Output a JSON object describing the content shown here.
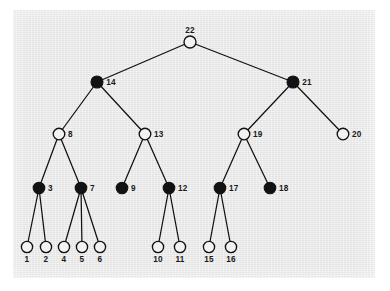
{
  "figure": {
    "title": "",
    "panel": {
      "background_color": "#e8e8e8",
      "border_color": "#ffffff",
      "x": 13,
      "y": 10,
      "width": 362,
      "height": 268
    },
    "style": {
      "edge_color": "#111111",
      "open_node_fill": "#f2f2f2",
      "filled_node_fill": "#121212",
      "node_stroke": "#111111",
      "label_color": "#1a1a1a"
    }
  },
  "chart_data": {
    "type": "diagram",
    "diagram_kind": "rooted-tree",
    "title": "",
    "xlabel": "",
    "ylabel": "",
    "legend": [
      {
        "marker": "filled-circle",
        "label": "black node"
      },
      {
        "marker": "open-circle",
        "label": "white node"
      }
    ],
    "node_count": 22,
    "levels": 5,
    "nodes": [
      {
        "id": "1",
        "label": "1",
        "fill": "open",
        "x": 27,
        "y": 247,
        "r": 5.6,
        "label_pos": "below",
        "depth": 4
      },
      {
        "id": "2",
        "label": "2",
        "fill": "open",
        "x": 46,
        "y": 247,
        "r": 5.6,
        "label_pos": "below",
        "depth": 4
      },
      {
        "id": "3",
        "label": "3",
        "fill": "filled",
        "x": 39,
        "y": 188,
        "r": 5.8,
        "label_pos": "right",
        "depth": 3
      },
      {
        "id": "4",
        "label": "4",
        "fill": "open",
        "x": 64,
        "y": 247,
        "r": 5.6,
        "label_pos": "below",
        "depth": 4
      },
      {
        "id": "5",
        "label": "5",
        "fill": "open",
        "x": 82,
        "y": 247,
        "r": 5.6,
        "label_pos": "below",
        "depth": 4
      },
      {
        "id": "6",
        "label": "6",
        "fill": "open",
        "x": 100,
        "y": 247,
        "r": 5.6,
        "label_pos": "below",
        "depth": 4
      },
      {
        "id": "7",
        "label": "7",
        "fill": "filled",
        "x": 81,
        "y": 188,
        "r": 5.8,
        "label_pos": "right",
        "depth": 3
      },
      {
        "id": "8",
        "label": "8",
        "fill": "open",
        "x": 59,
        "y": 134,
        "r": 5.8,
        "label_pos": "right",
        "depth": 2
      },
      {
        "id": "9",
        "label": "9",
        "fill": "filled",
        "x": 122,
        "y": 188,
        "r": 5.8,
        "label_pos": "right",
        "depth": 3
      },
      {
        "id": "10",
        "label": "10",
        "fill": "open",
        "x": 158,
        "y": 247,
        "r": 5.6,
        "label_pos": "below",
        "depth": 4
      },
      {
        "id": "11",
        "label": "11",
        "fill": "open",
        "x": 180,
        "y": 247,
        "r": 5.6,
        "label_pos": "below",
        "depth": 4
      },
      {
        "id": "12",
        "label": "12",
        "fill": "filled",
        "x": 169,
        "y": 188,
        "r": 5.8,
        "label_pos": "right",
        "depth": 3
      },
      {
        "id": "13",
        "label": "13",
        "fill": "open",
        "x": 145,
        "y": 134,
        "r": 5.8,
        "label_pos": "right",
        "depth": 2
      },
      {
        "id": "14",
        "label": "14",
        "fill": "filled",
        "x": 97,
        "y": 82,
        "r": 6.0,
        "label_pos": "right",
        "depth": 1
      },
      {
        "id": "15",
        "label": "15",
        "fill": "open",
        "x": 209,
        "y": 247,
        "r": 5.6,
        "label_pos": "below",
        "depth": 4
      },
      {
        "id": "16",
        "label": "16",
        "fill": "open",
        "x": 231,
        "y": 247,
        "r": 5.6,
        "label_pos": "below",
        "depth": 4
      },
      {
        "id": "17",
        "label": "17",
        "fill": "filled",
        "x": 220,
        "y": 188,
        "r": 5.8,
        "label_pos": "right",
        "depth": 3
      },
      {
        "id": "18",
        "label": "18",
        "fill": "filled",
        "x": 270,
        "y": 188,
        "r": 5.8,
        "label_pos": "right",
        "depth": 3
      },
      {
        "id": "19",
        "label": "19",
        "fill": "open",
        "x": 244,
        "y": 134,
        "r": 5.8,
        "label_pos": "right",
        "depth": 2
      },
      {
        "id": "20",
        "label": "20",
        "fill": "open",
        "x": 343,
        "y": 134,
        "r": 5.8,
        "label_pos": "right",
        "depth": 2
      },
      {
        "id": "21",
        "label": "21",
        "fill": "filled",
        "x": 293,
        "y": 82,
        "r": 6.0,
        "label_pos": "right",
        "depth": 1
      },
      {
        "id": "22",
        "label": "22",
        "fill": "open",
        "x": 190,
        "y": 42,
        "r": 6.0,
        "label_pos": "above",
        "depth": 0
      }
    ],
    "edges": [
      {
        "from": "22",
        "to": "14"
      },
      {
        "from": "22",
        "to": "21"
      },
      {
        "from": "14",
        "to": "8"
      },
      {
        "from": "14",
        "to": "13"
      },
      {
        "from": "21",
        "to": "19"
      },
      {
        "from": "21",
        "to": "20"
      },
      {
        "from": "8",
        "to": "3"
      },
      {
        "from": "8",
        "to": "7"
      },
      {
        "from": "13",
        "to": "9"
      },
      {
        "from": "13",
        "to": "12"
      },
      {
        "from": "19",
        "to": "17"
      },
      {
        "from": "19",
        "to": "18"
      },
      {
        "from": "3",
        "to": "1"
      },
      {
        "from": "3",
        "to": "2"
      },
      {
        "from": "7",
        "to": "4"
      },
      {
        "from": "7",
        "to": "5"
      },
      {
        "from": "7",
        "to": "6"
      },
      {
        "from": "12",
        "to": "10"
      },
      {
        "from": "12",
        "to": "11"
      },
      {
        "from": "17",
        "to": "15"
      },
      {
        "from": "17",
        "to": "16"
      }
    ]
  }
}
